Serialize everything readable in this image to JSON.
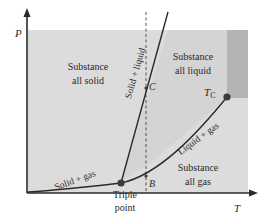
{
  "diagram": {
    "type": "phase-diagram",
    "axes": {
      "x_label": "T",
      "y_label": "P"
    },
    "regions": {
      "solid": [
        "Substance",
        "all solid"
      ],
      "liquid": [
        "Substance",
        "all liquid"
      ],
      "gas": [
        "Substance",
        "all gas"
      ]
    },
    "curves": {
      "solid_liquid": "Solid + liquid",
      "liquid_gas": "Liquid + gas",
      "solid_gas": "Solid + gas"
    },
    "points": {
      "triple": [
        "Triple",
        "point"
      ],
      "critical_main": "T",
      "critical_sub": "C",
      "C": "C",
      "B": "B"
    },
    "colors": {
      "background": "#dcdcdc",
      "liquid_region": "#d3d3d3",
      "supercritical": "#b4b4b4",
      "curve": "#2a2a2a",
      "point": "#3a3a3a"
    }
  }
}
